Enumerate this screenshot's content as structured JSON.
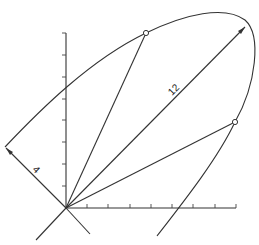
{
  "diagram": {
    "type": "geometric-construction",
    "labels": {
      "long_dimension": "12",
      "short_dimension": "4"
    },
    "axes": {
      "x_ticks": 8,
      "y_ticks": 8
    },
    "colors": {
      "line": "#333333",
      "background": "#ffffff"
    }
  }
}
